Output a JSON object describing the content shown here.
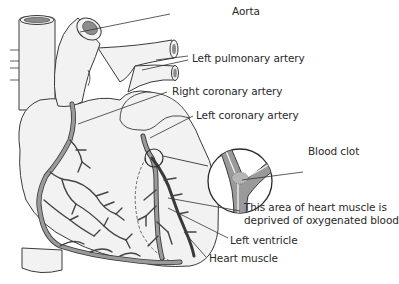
{
  "diagram": {
    "colors": {
      "background": "#ffffff",
      "tissue_fill": "#f2f2f2",
      "outline": "#3a3a3a",
      "artery_fill": "#9a9a9a",
      "vessel_lumen": "#8c8c8c",
      "leader_line": "#333333",
      "text": "#2a2a2a"
    },
    "labels": [
      {
        "id": "aorta",
        "text": "Aorta"
      },
      {
        "id": "left-pulmonary-artery",
        "text": "Left pulmonary artery"
      },
      {
        "id": "right-coronary-artery",
        "text": "Right coronary artery"
      },
      {
        "id": "left-coronary-artery",
        "text": "Left coronary artery"
      },
      {
        "id": "blood-clot",
        "text": "Blood clot"
      },
      {
        "id": "deprived-area",
        "text": "This area of heart muscle is\ndeprived of oxygenated blood",
        "lines": [
          "This area of heart muscle is",
          "deprived of oxygenated blood"
        ]
      },
      {
        "id": "left-ventricle",
        "text": "Left ventricle"
      },
      {
        "id": "heart-muscle",
        "text": "Heart muscle"
      }
    ]
  }
}
